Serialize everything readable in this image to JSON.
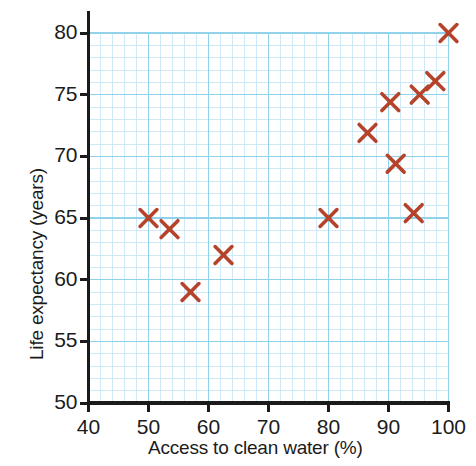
{
  "chart_data": {
    "type": "scatter",
    "title": "",
    "xlabel": "Access to clean water (%)",
    "ylabel": "Life expectancy (years)",
    "xlim": [
      40,
      100
    ],
    "ylim": [
      50,
      80
    ],
    "xticks": [
      40,
      50,
      60,
      70,
      80,
      90,
      100
    ],
    "yticks": [
      50,
      55,
      60,
      65,
      70,
      75,
      80
    ],
    "xtick_labels": [
      "40",
      "50",
      "60",
      "70",
      "80",
      "90",
      "100"
    ],
    "ytick_labels": [
      "50",
      "55",
      "60",
      "65",
      "70",
      "75",
      "80"
    ],
    "grid": true,
    "grid_major_step_x": 10,
    "grid_minor_step_x": 2,
    "grid_major_step_y": 5,
    "grid_minor_step_y": 1,
    "grid_color_major": "#8fd2ea",
    "grid_color_minor": "#cfeaf6",
    "marker": "x",
    "marker_color": "#b5432c",
    "series": [
      {
        "name": "Countries",
        "points": [
          {
            "x": 50.0,
            "y": 65.0
          },
          {
            "x": 53.5,
            "y": 64.1
          },
          {
            "x": 57.0,
            "y": 59.0
          },
          {
            "x": 62.5,
            "y": 62.0
          },
          {
            "x": 80.0,
            "y": 65.0
          },
          {
            "x": 86.5,
            "y": 71.9
          },
          {
            "x": 90.3,
            "y": 74.4
          },
          {
            "x": 91.2,
            "y": 69.4
          },
          {
            "x": 94.2,
            "y": 65.4
          },
          {
            "x": 95.2,
            "y": 75.0
          },
          {
            "x": 97.8,
            "y": 76.1
          },
          {
            "x": 100.0,
            "y": 80.0
          }
        ]
      }
    ]
  },
  "axes": {
    "axis_color": "#1b1b1b",
    "background": "#ffffff",
    "plot_background": "#ffffff"
  }
}
